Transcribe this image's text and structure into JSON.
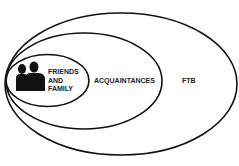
{
  "diagram": {
    "type": "nested-ellipses",
    "colors": {
      "stroke": "#111111",
      "background": "#ffffff",
      "silhouette": "#111111"
    },
    "circles": [
      {
        "id": "outer",
        "label": "FTB"
      },
      {
        "id": "middle",
        "label": "ACQUAINTANCES"
      },
      {
        "id": "inner",
        "label_lines": [
          "FRIENDS",
          "AND",
          "FAMILY"
        ],
        "icon": "people-silhouette-icon"
      }
    ]
  }
}
